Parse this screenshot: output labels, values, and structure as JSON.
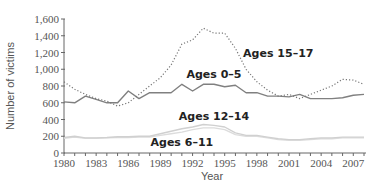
{
  "chart_data": {
    "type": "line",
    "title": "",
    "xlabel": "Year",
    "ylabel": "Number of victims",
    "xlim": [
      1980,
      2008
    ],
    "ylim": [
      0,
      1600
    ],
    "grid": false,
    "legend_position": "inline labels",
    "x_ticks": [
      1980,
      1983,
      1986,
      1989,
      1992,
      1995,
      1998,
      2001,
      2004,
      2007
    ],
    "x_tick_labels": [
      "1980",
      "1983",
      "1986",
      "1989",
      "1992",
      "1995",
      "1998",
      "2001",
      "2004",
      "2007"
    ],
    "y_ticks": [
      0,
      200,
      400,
      600,
      800,
      1000,
      1200,
      1400,
      1600
    ],
    "y_tick_labels": [
      "0",
      "200",
      "400",
      "600",
      "800",
      "1,000",
      "1,200",
      "1,400",
      "1,600"
    ],
    "x": [
      1980,
      1981,
      1982,
      1983,
      1984,
      1985,
      1986,
      1987,
      1988,
      1989,
      1990,
      1991,
      1992,
      1993,
      1994,
      1995,
      1996,
      1997,
      1998,
      1999,
      2000,
      2001,
      2002,
      2003,
      2004,
      2005,
      2006,
      2007,
      2008
    ],
    "series": [
      {
        "name": "Ages 15–17",
        "style": "dotted",
        "color": "#777777",
        "values": [
          850,
          760,
          700,
          650,
          620,
          560,
          600,
          700,
          800,
          900,
          1050,
          1300,
          1350,
          1490,
          1430,
          1430,
          1250,
          1000,
          850,
          750,
          680,
          700,
          650,
          700,
          750,
          800,
          880,
          870,
          820
        ]
      },
      {
        "name": "Ages 0–5",
        "style": "solid",
        "color": "#808080",
        "values": [
          610,
          600,
          680,
          640,
          600,
          600,
          740,
          650,
          720,
          720,
          720,
          820,
          740,
          820,
          820,
          790,
          810,
          720,
          720,
          680,
          680,
          670,
          700,
          650,
          650,
          650,
          660,
          690,
          700
        ]
      },
      {
        "name": "Ages 12–14",
        "style": "solid",
        "color": "#d0d0d0",
        "values": [
          185,
          200,
          180,
          180,
          185,
          195,
          195,
          200,
          200,
          230,
          260,
          290,
          310,
          340,
          330,
          310,
          240,
          210,
          210,
          190,
          170,
          160,
          160,
          170,
          180,
          180,
          190,
          190,
          190
        ]
      },
      {
        "name": "Ages 6–11",
        "style": "solid",
        "color": "#dcdcdc",
        "values": [
          175,
          190,
          175,
          175,
          180,
          185,
          185,
          190,
          190,
          210,
          230,
          250,
          280,
          300,
          300,
          280,
          220,
          200,
          200,
          180,
          160,
          150,
          150,
          160,
          170,
          170,
          180,
          180,
          180
        ]
      }
    ],
    "annotations": [
      {
        "text": "Ages 15–17",
        "x": 2000,
        "y": 1150
      },
      {
        "text": "Ages 0–5",
        "x": 1994,
        "y": 900
      },
      {
        "text": "Ages 12–14",
        "x": 1994,
        "y": 400
      },
      {
        "text": "Ages 6–11",
        "x": 1991,
        "y": 80
      }
    ]
  }
}
